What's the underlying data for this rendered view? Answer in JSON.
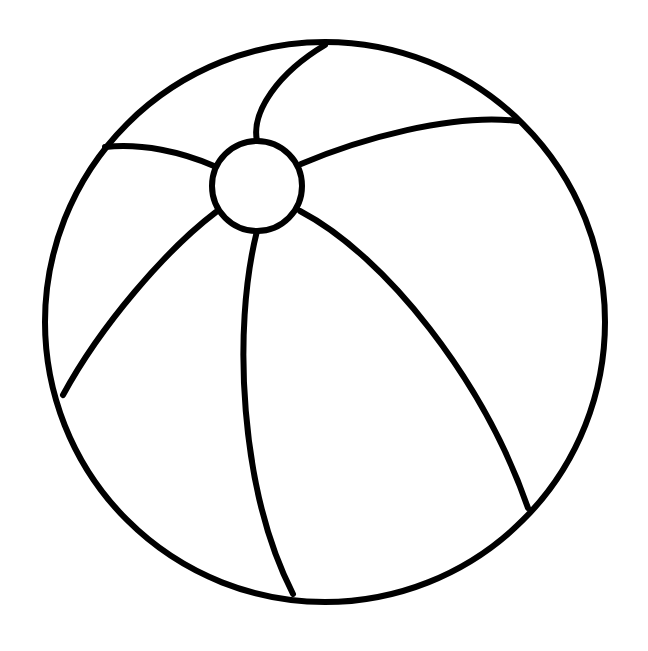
{
  "document": {
    "title": "Beach Ball Coloring Page",
    "kind": "line-art-coloring-page",
    "subject": "beach ball",
    "canvas": {
      "width": 648,
      "height": 651
    },
    "background_color": "#ffffff",
    "ink_color": "#000000",
    "fill_color": "none",
    "stroke_width": 6,
    "visible_text": "",
    "panel_count": 6
  },
  "artwork": {
    "name": "beach-ball",
    "outline": {
      "name": "ball-outline",
      "shape": "circle",
      "cx": 325,
      "cy": 322,
      "r": 280,
      "stroke_width": 6
    },
    "hub": {
      "name": "ball-hub",
      "shape": "circle",
      "cx": 257,
      "cy": 186,
      "r": 45,
      "stroke_width": 6
    },
    "seams": [
      {
        "name": "seam-top",
        "from": [
          257,
          141
        ],
        "to": [
          325,
          45
        ],
        "path": "M 257 141 C 251 112 278 73 325 45",
        "stroke_width": 6
      },
      {
        "name": "seam-upper-right",
        "from": [
          301,
          164
        ],
        "to": [
          518,
          121
        ],
        "path": "M 301 164 C 360 139 452 113 518 121",
        "stroke_width": 6
      },
      {
        "name": "seam-lower-right",
        "from": [
          300,
          211
        ],
        "to": [
          528,
          508
        ],
        "path": "M 300 211 C 386 256 484 381 528 508",
        "stroke_width": 6
      },
      {
        "name": "seam-bottom",
        "from": [
          257,
          231
        ],
        "to": [
          293,
          594
        ],
        "path": "M 257 231 C 232 330 240 490 293 594",
        "stroke_width": 6
      },
      {
        "name": "seam-lower-left",
        "from": [
          216,
          212
        ],
        "to": [
          63,
          395
        ],
        "path": "M 216 212 C 166 250 101 325 63 395",
        "stroke_width": 6
      },
      {
        "name": "seam-left",
        "from": [
          214,
          166
        ],
        "to": [
          105,
          147
        ],
        "path": "M 214 166 C 182 152 142 143 105 147",
        "stroke_width": 6
      }
    ],
    "panels": [
      {
        "name": "panel-top",
        "between": [
          "seam-top",
          "seam-upper-right"
        ]
      },
      {
        "name": "panel-right",
        "between": [
          "seam-upper-right",
          "seam-lower-right"
        ]
      },
      {
        "name": "panel-bottom-right",
        "between": [
          "seam-lower-right",
          "seam-bottom"
        ]
      },
      {
        "name": "panel-bottom-left",
        "between": [
          "seam-bottom",
          "seam-lower-left"
        ]
      },
      {
        "name": "panel-left",
        "between": [
          "seam-lower-left",
          "seam-left"
        ]
      },
      {
        "name": "panel-top-left",
        "between": [
          "seam-left",
          "seam-top"
        ]
      }
    ]
  }
}
